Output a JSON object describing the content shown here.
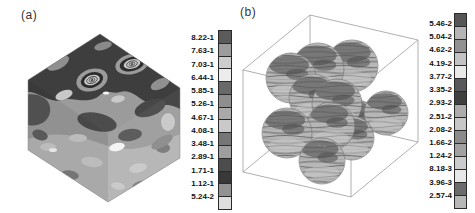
{
  "panels": [
    {
      "id": "a",
      "label": "(a)",
      "legend": {
        "labels": [
          "8.22-1",
          "7.63-1",
          "7.03-1",
          "6.44-1",
          "5.85-1",
          "5.26-1",
          "4.67-1",
          "4.08-1",
          "3.48-1",
          "2.89-1",
          "1.71-1",
          "1.12-1",
          "5.24-2"
        ],
        "colors": [
          "#5b5b5b",
          "#9c9c9c",
          "#cdcdcd",
          "#ececec",
          "#696969",
          "#8e8e8e",
          "#a9a9a9",
          "#c9c9c9",
          "#767676",
          "#9e9e9e",
          "#4c4c4c",
          "#383838",
          "#929292",
          "#dedede"
        ]
      }
    },
    {
      "id": "b",
      "label": "(b)",
      "legend": {
        "labels": [
          "5.46-2",
          "5.04-2",
          "4.62-2",
          "4.19-2",
          "3.77-2",
          "3.35-2",
          "2.93-2",
          "2.51-2",
          "2.08-2",
          "1.66-2",
          "1.24-2",
          "8.18-3",
          "3.96-3",
          "2.57-4"
        ],
        "colors": [
          "#565656",
          "#b5b5b5",
          "#919191",
          "#c3c3c3",
          "#e9e9e9",
          "#595959",
          "#3f3f3f",
          "#acacac",
          "#c7c7c7",
          "#8b8b8b",
          "#a1a1a1",
          "#cbcbcb",
          "#e7e7e7",
          "#6b6b6b",
          "#b7b7b7"
        ]
      }
    }
  ],
  "chart_data": [
    {
      "type": "heatmap",
      "subtype": "3d-filled-contour-on-cube-surface",
      "title": "(a)",
      "legend_position": "right",
      "notation": "labels are mantissa-exponent, e.g. 8.22-1 = 8.22e-1",
      "legend_levels": [
        "8.22-1",
        "7.63-1",
        "7.03-1",
        "6.44-1",
        "5.85-1",
        "5.26-1",
        "4.67-1",
        "4.08-1",
        "3.48-1",
        "2.89-1",
        "1.71-1",
        "1.12-1",
        "5.24-2"
      ],
      "legend_colors": [
        "#5b5b5b",
        "#9c9c9c",
        "#cdcdcd",
        "#ececec",
        "#696969",
        "#8e8e8e",
        "#a9a9a9",
        "#c9c9c9",
        "#767676",
        "#9e9e9e",
        "#4c4c4c",
        "#383838",
        "#929292",
        "#dedede"
      ],
      "value_range": [
        "5.24-2",
        "8.22-1"
      ],
      "notable_features": "grayscale contour patches over an isometric cube; two concentric-ring (bullseye) features on the upper face"
    },
    {
      "type": "heatmap",
      "subtype": "3d-banded-contour-spheres-in-wireframe-box",
      "title": "(b)",
      "legend_position": "right",
      "notation": "labels are mantissa-exponent, e.g. 5.46-2 = 5.46e-2",
      "legend_levels": [
        "5.46-2",
        "5.04-2",
        "4.62-2",
        "4.19-2",
        "3.77-2",
        "3.35-2",
        "2.93-2",
        "2.51-2",
        "2.08-2",
        "1.66-2",
        "1.24-2",
        "8.18-3",
        "3.96-3",
        "2.57-4"
      ],
      "legend_colors": [
        "#565656",
        "#b5b5b5",
        "#919191",
        "#c3c3c3",
        "#e9e9e9",
        "#595959",
        "#3f3f3f",
        "#acacac",
        "#c7c7c7",
        "#8b8b8b",
        "#a1a1a1",
        "#cbcbcb",
        "#e7e7e7",
        "#6b6b6b",
        "#b7b7b7"
      ],
      "value_range": [
        "2.57-4",
        "5.46-2"
      ],
      "sphere_count": 11,
      "spheres": [
        {
          "x": 352,
          "y": 66,
          "r": 26
        },
        {
          "x": 318,
          "y": 69,
          "r": 26
        },
        {
          "x": 291,
          "y": 78,
          "r": 25
        },
        {
          "x": 357,
          "y": 120,
          "r": 20
        },
        {
          "x": 313,
          "y": 98,
          "r": 24
        },
        {
          "x": 337,
          "y": 104,
          "r": 25
        },
        {
          "x": 386,
          "y": 113,
          "r": 22
        },
        {
          "x": 352,
          "y": 138,
          "r": 22
        },
        {
          "x": 331,
          "y": 126,
          "r": 24
        },
        {
          "x": 287,
          "y": 133,
          "r": 25
        },
        {
          "x": 322,
          "y": 161,
          "r": 23
        }
      ]
    }
  ]
}
